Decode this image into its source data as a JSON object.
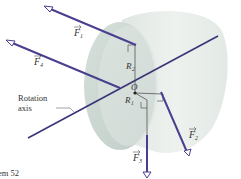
{
  "figure": {
    "caption_fragment": "em 52",
    "colors": {
      "force_arrow": "#4a3f8f",
      "cylinder_light": "#e6ece8",
      "cylinder_shade": "#c8d4cf",
      "thin_line": "#444444",
      "text": "#333333"
    },
    "labels": {
      "F1": "F",
      "F1_sub": "1",
      "F2": "F",
      "F2_sub": "2",
      "F3": "F",
      "F3_sub": "3",
      "F4": "F",
      "F4_sub": "4",
      "R1": "R",
      "R1_sub": "1",
      "R2": "R",
      "R2_sub": "2",
      "origin": "O",
      "axis_line1": "Rotation",
      "axis_line2": "axis"
    }
  }
}
